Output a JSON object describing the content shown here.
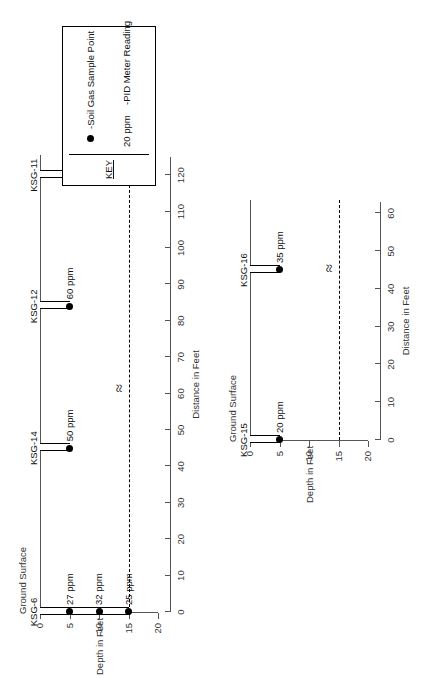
{
  "key": {
    "title": "KEY",
    "sample_point_label": "-Soil Gas Sample Point",
    "pid_value": "20 ppm",
    "pid_label": "-PID Meter Reading",
    "dot_icon": "filled-circle"
  },
  "common": {
    "ground_surface_label": "Ground Surface",
    "depth_axis_title": "Depth in Feet",
    "distance_axis_title": "Distance in Feet",
    "break_symbol": "≈",
    "units": "ppm"
  },
  "chart_data": [
    {
      "id": "upper-cross-section",
      "type": "scatter",
      "title": "",
      "xlabel": "Distance in Feet",
      "ylabel": "Depth in Feet",
      "xlim": [
        0,
        125
      ],
      "ylim": [
        0,
        20
      ],
      "y_inverted": true,
      "xticks": [
        0,
        10,
        20,
        30,
        40,
        50,
        60,
        70,
        80,
        90,
        100,
        110,
        120
      ],
      "yticks": [
        0,
        5,
        10,
        15,
        20
      ],
      "ground_surface_depth": 0,
      "water_table_depth": 15,
      "break_at_distance": 62,
      "borings": [
        {
          "name": "KSG-6",
          "distance": 0,
          "samples": [
            {
              "depth": 5,
              "value": 27,
              "label": "27 ppm"
            },
            {
              "depth": 10,
              "value": 32,
              "label": "32 ppm"
            },
            {
              "depth": 15,
              "value": 25,
              "label": "25 ppm"
            }
          ]
        },
        {
          "name": "KSG-14",
          "distance": 45,
          "samples": [
            {
              "depth": 5,
              "value": 50,
              "label": "50 ppm"
            }
          ]
        },
        {
          "name": "KSG-12",
          "distance": 84,
          "samples": [
            {
              "depth": 5,
              "value": 60,
              "label": "60 ppm"
            }
          ]
        },
        {
          "name": "KSG-11",
          "distance": 120,
          "samples": [
            {
              "depth": 5,
              "value": 10,
              "label": "10 ppm"
            },
            {
              "depth": 10,
              "value": 9,
              "label": "9 ppm"
            },
            {
              "depth": 15,
              "value": 10,
              "label": "10 ppm"
            }
          ]
        }
      ]
    },
    {
      "id": "lower-cross-section",
      "type": "scatter",
      "title": "",
      "xlabel": "Distance in Feet",
      "ylabel": "Depth in Feet",
      "xlim": [
        0,
        63
      ],
      "ylim": [
        0,
        20
      ],
      "y_inverted": true,
      "xticks": [
        0,
        10,
        20,
        30,
        40,
        50,
        60
      ],
      "yticks": [
        0,
        5,
        10,
        15,
        20
      ],
      "ground_surface_depth": 0,
      "water_table_depth": 15,
      "break_at_distance": 46,
      "borings": [
        {
          "name": "KSG-15",
          "distance": 0,
          "samples": [
            {
              "depth": 5,
              "value": 20,
              "label": "20 ppm"
            }
          ]
        },
        {
          "name": "KSG-16",
          "distance": 45,
          "samples": [
            {
              "depth": 5,
              "value": 35,
              "label": "35 ppm"
            }
          ]
        }
      ]
    }
  ]
}
